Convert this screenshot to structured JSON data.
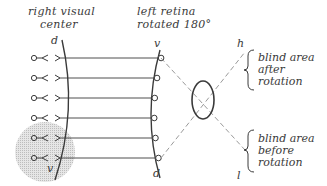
{
  "titles": {
    "left_line1": "right visual",
    "left_line2": "center",
    "right_line1": "left retina",
    "right_line2": "rotated 180°"
  },
  "poles": {
    "center_top": "d",
    "center_bottom": "v",
    "retina_top": "v",
    "retina_bottom": "d",
    "field_top": "h",
    "field_bottom": "l"
  },
  "annotations": {
    "upper": {
      "line1": "blind area",
      "line2": "after",
      "line3": "rotation"
    },
    "lower": {
      "line1": "blind area",
      "line2": "before",
      "line3": "rotation"
    }
  },
  "rows": [
    {
      "y": 58,
      "shaded": false
    },
    {
      "y": 78,
      "shaded": false
    },
    {
      "y": 98,
      "shaded": false
    },
    {
      "y": 118,
      "shaded": false
    },
    {
      "y": 138,
      "shaded": true
    },
    {
      "y": 158,
      "shaded": true
    }
  ],
  "colors": {
    "ink": "#3a3a3a",
    "dashed": "#9a9a9a",
    "shade": "#cfcfcf"
  }
}
